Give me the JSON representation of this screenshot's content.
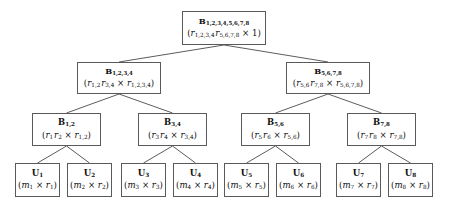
{
  "diagram": {
    "type": "binary-tree",
    "background_color": "#ffffff",
    "edge_color": "#4a4a4a",
    "box_border_color": "#5a5a5a",
    "text_color": "#101010",
    "levels": 4,
    "nodes": [
      {
        "id": "root",
        "level": 0,
        "name": "B",
        "subscript": "1,2,3,4,5,6,7,8",
        "expr": "(r1,2,3,4 r5,6,7,8 × 1)",
        "expr_parts": {
          "open": "(",
          "term1": "r",
          "term1_sub": "1,2,3,4",
          "term2": "r",
          "term2_sub": "5,6,7,8",
          "operator": "×",
          "term3": "1",
          "term3_sub": "",
          "close": ")"
        },
        "x": 182,
        "y": 11,
        "w": 84,
        "h": 34
      },
      {
        "id": "b1234",
        "level": 1,
        "name": "B",
        "subscript": "1,2,3,4",
        "expr": "(r1,2 r3,4 × r1,2,3,4)",
        "expr_parts": {
          "open": "(",
          "term1": "r",
          "term1_sub": "1,2",
          "term2": "r",
          "term2_sub": "3,4",
          "operator": "×",
          "term3": "r",
          "term3_sub": "1,2,3,4",
          "close": ")"
        },
        "x": 77,
        "y": 62,
        "w": 84,
        "h": 32
      },
      {
        "id": "b5678",
        "level": 1,
        "name": "B",
        "subscript": "5,6,7,8",
        "expr": "(r5,6 r7,8 × r5,6,7,8)",
        "expr_parts": {
          "open": "(",
          "term1": "r",
          "term1_sub": "5,6",
          "term2": "r",
          "term2_sub": "7,8",
          "operator": "×",
          "term3": "r",
          "term3_sub": "5,6,7,8",
          "close": ")"
        },
        "x": 286,
        "y": 62,
        "w": 84,
        "h": 32
      },
      {
        "id": "b12",
        "level": 2,
        "name": "B",
        "subscript": "1,2",
        "expr": "(r1 r2 × r1,2)",
        "expr_parts": {
          "open": "(",
          "term1": "r",
          "term1_sub": "1",
          "term2": "r",
          "term2_sub": "2",
          "operator": "×",
          "term3": "r",
          "term3_sub": "1,2",
          "close": ")"
        },
        "x": 32,
        "y": 113,
        "w": 69,
        "h": 33
      },
      {
        "id": "b34",
        "level": 2,
        "name": "B",
        "subscript": "3,4",
        "expr": "(r3 r4 × r3,4)",
        "expr_parts": {
          "open": "(",
          "term1": "r",
          "term1_sub": "3",
          "term2": "r",
          "term2_sub": "4",
          "operator": "×",
          "term3": "r",
          "term3_sub": "3,4",
          "close": ")"
        },
        "x": 138,
        "y": 113,
        "w": 69,
        "h": 33
      },
      {
        "id": "b56",
        "level": 2,
        "name": "B",
        "subscript": "5,6",
        "expr": "(r5 r6 × r5,6)",
        "expr_parts": {
          "open": "(",
          "term1": "r",
          "term1_sub": "5",
          "term2": "r",
          "term2_sub": "6",
          "operator": "×",
          "term3": "r",
          "term3_sub": "5,6",
          "close": ")"
        },
        "x": 241,
        "y": 113,
        "w": 69,
        "h": 33
      },
      {
        "id": "b78",
        "level": 2,
        "name": "B",
        "subscript": "7,8",
        "expr": "(r7 r8 × r7,8)",
        "expr_parts": {
          "open": "(",
          "term1": "r",
          "term1_sub": "7",
          "term2": "r",
          "term2_sub": "8",
          "operator": "×",
          "term3": "r",
          "term3_sub": "7,8",
          "close": ")"
        },
        "x": 347,
        "y": 113,
        "w": 69,
        "h": 33
      },
      {
        "id": "u1",
        "level": 3,
        "name": "U",
        "subscript": "1",
        "expr": "(m1 × r1)",
        "expr_parts": {
          "open": "(",
          "term1": "m",
          "term1_sub": "1",
          "operator": "×",
          "term3": "r",
          "term3_sub": "1",
          "close": ")"
        },
        "x": 15,
        "y": 163,
        "w": 45,
        "h": 34
      },
      {
        "id": "u2",
        "level": 3,
        "name": "U",
        "subscript": "2",
        "expr": "(m2 × r2)",
        "expr_parts": {
          "open": "(",
          "term1": "m",
          "term1_sub": "2",
          "operator": "×",
          "term3": "r",
          "term3_sub": "2",
          "close": ")"
        },
        "x": 67,
        "y": 163,
        "w": 45,
        "h": 34
      },
      {
        "id": "u3",
        "level": 3,
        "name": "U",
        "subscript": "3",
        "expr": "(m3 × r3)",
        "expr_parts": {
          "open": "(",
          "term1": "m",
          "term1_sub": "3",
          "operator": "×",
          "term3": "r",
          "term3_sub": "3",
          "close": ")"
        },
        "x": 121,
        "y": 163,
        "w": 45,
        "h": 34
      },
      {
        "id": "u4",
        "level": 3,
        "name": "U",
        "subscript": "4",
        "expr": "(m4 × r4)",
        "expr_parts": {
          "open": "(",
          "term1": "m",
          "term1_sub": "4",
          "operator": "×",
          "term3": "r",
          "term3_sub": "4",
          "close": ")"
        },
        "x": 173,
        "y": 163,
        "w": 45,
        "h": 34
      },
      {
        "id": "u5",
        "level": 3,
        "name": "U",
        "subscript": "5",
        "expr": "(m5 × r5)",
        "expr_parts": {
          "open": "(",
          "term1": "m",
          "term1_sub": "5",
          "operator": "×",
          "term3": "r",
          "term3_sub": "5",
          "close": ")"
        },
        "x": 224,
        "y": 163,
        "w": 45,
        "h": 34
      },
      {
        "id": "u6",
        "level": 3,
        "name": "U",
        "subscript": "6",
        "expr": "(m6 × r6)",
        "expr_parts": {
          "open": "(",
          "term1": "m",
          "term1_sub": "6",
          "operator": "×",
          "term3": "r",
          "term3_sub": "6",
          "close": ")"
        },
        "x": 276,
        "y": 163,
        "w": 45,
        "h": 34
      },
      {
        "id": "u7",
        "level": 3,
        "name": "U",
        "subscript": "7",
        "expr": "(m7 × r7)",
        "expr_parts": {
          "open": "(",
          "term1": "m",
          "term1_sub": "7",
          "operator": "×",
          "term3": "r",
          "term3_sub": "7",
          "close": ")"
        },
        "x": 336,
        "y": 163,
        "w": 45,
        "h": 34
      },
      {
        "id": "u8",
        "level": 3,
        "name": "U",
        "subscript": "8",
        "expr": "(m8 × r8)",
        "expr_parts": {
          "open": "(",
          "term1": "m",
          "term1_sub": "8",
          "operator": "×",
          "term3": "r",
          "term3_sub": "8",
          "close": ")"
        },
        "x": 388,
        "y": 163,
        "w": 45,
        "h": 34
      }
    ],
    "edges": [
      {
        "from": "root",
        "to": "b1234"
      },
      {
        "from": "root",
        "to": "b5678"
      },
      {
        "from": "b1234",
        "to": "b12"
      },
      {
        "from": "b1234",
        "to": "b34"
      },
      {
        "from": "b5678",
        "to": "b56"
      },
      {
        "from": "b5678",
        "to": "b78"
      },
      {
        "from": "b12",
        "to": "u1"
      },
      {
        "from": "b12",
        "to": "u2"
      },
      {
        "from": "b34",
        "to": "u3"
      },
      {
        "from": "b34",
        "to": "u4"
      },
      {
        "from": "b56",
        "to": "u5"
      },
      {
        "from": "b56",
        "to": "u6"
      },
      {
        "from": "b78",
        "to": "u7"
      },
      {
        "from": "b78",
        "to": "u8"
      }
    ]
  }
}
